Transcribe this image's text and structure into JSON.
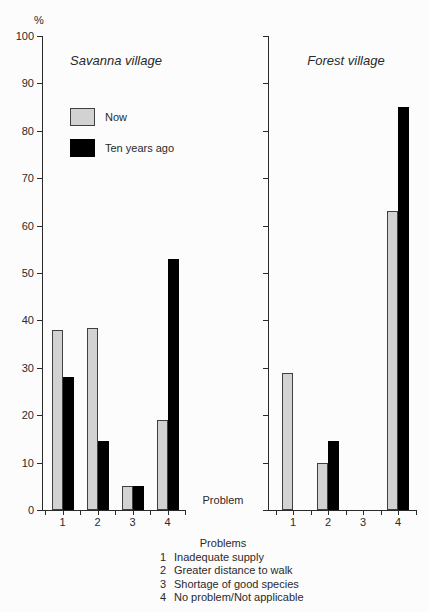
{
  "ylabel": "%",
  "problem_axis_label": "Problem",
  "colors": {
    "now_fill": "#d2d2d2",
    "now_border": "#3f3f3f",
    "ten_years_ago": "#000000",
    "axis": "#2a2a2a"
  },
  "problems_key": {
    "title": "Problems",
    "items": [
      {
        "num": "1",
        "label": "Inadequate supply"
      },
      {
        "num": "2",
        "label": "Greater distance to walk"
      },
      {
        "num": "3",
        "label": "Shortage of good species"
      },
      {
        "num": "4",
        "label": "No problem/Not applicable"
      }
    ]
  },
  "chart_data": [
    {
      "type": "bar",
      "title": "Savanna village",
      "categories": [
        "1",
        "2",
        "3",
        "4"
      ],
      "series": [
        {
          "name": "Now",
          "values": [
            38,
            38.5,
            5,
            19
          ]
        },
        {
          "name": "Ten years ago",
          "values": [
            28,
            14.5,
            5,
            53
          ]
        }
      ],
      "xlabel": "Problem",
      "ylabel": "%",
      "ylim": [
        0,
        100
      ],
      "ytick_step": 10,
      "grid": false,
      "legend_position": "upper-left-inside"
    },
    {
      "type": "bar",
      "title": "Forest village",
      "categories": [
        "1",
        "2",
        "3",
        "4"
      ],
      "series": [
        {
          "name": "Now",
          "values": [
            29,
            10,
            0,
            63
          ]
        },
        {
          "name": "Ten years ago",
          "values": [
            0,
            14.5,
            0,
            85
          ]
        }
      ],
      "xlabel": "Problem",
      "ylabel": "%",
      "ylim": [
        0,
        100
      ],
      "ytick_step": 10,
      "grid": false,
      "legend_position": "none"
    }
  ]
}
